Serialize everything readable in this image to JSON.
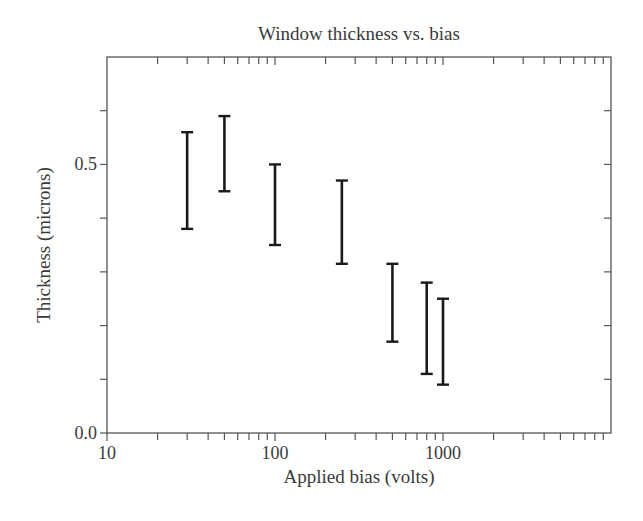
{
  "chart_data": {
    "type": "errorbar",
    "title": "Window thickness vs. bias",
    "xlabel": "Applied bias (volts)",
    "ylabel": "Thickness (microns)",
    "xscale": "log",
    "xlim": [
      10,
      10000
    ],
    "ylim": [
      0.0,
      0.7
    ],
    "x_tick_labels": [
      "10",
      "100",
      "1000"
    ],
    "x_ticks": [
      10,
      100,
      1000
    ],
    "y_tick_labels": [
      "0.0",
      "0.5"
    ],
    "y_ticks": [
      0.0,
      0.5
    ],
    "y_minor_ticks": [
      0.1,
      0.2,
      0.3,
      0.4,
      0.6
    ],
    "grid": false,
    "legend": null,
    "series": [
      {
        "name": "thickness range",
        "x": [
          30,
          50,
          100,
          250,
          500,
          800,
          1000
        ],
        "y_low": [
          0.38,
          0.45,
          0.35,
          0.315,
          0.17,
          0.11,
          0.09
        ],
        "y_high": [
          0.56,
          0.59,
          0.5,
          0.47,
          0.315,
          0.28,
          0.25
        ]
      }
    ]
  },
  "style": {
    "axis_color": "#555555",
    "bar_color": "#1a1a1a",
    "text_color": "#3a3a3a"
  }
}
